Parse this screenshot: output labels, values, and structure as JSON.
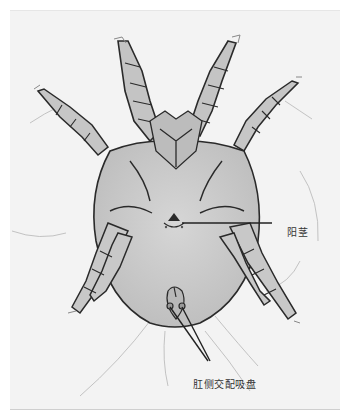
{
  "figure": {
    "background_color": "#f3f3f3",
    "body_color": "#c9c9c9",
    "outline_color": "#2a2a2a"
  },
  "labels": {
    "penis": {
      "text": "阳茎",
      "meaning": "aedeagus / penis"
    },
    "paranal_suckers": {
      "text": "肛侧交配吸盘",
      "meaning": "paranal copulatory suckers"
    }
  }
}
